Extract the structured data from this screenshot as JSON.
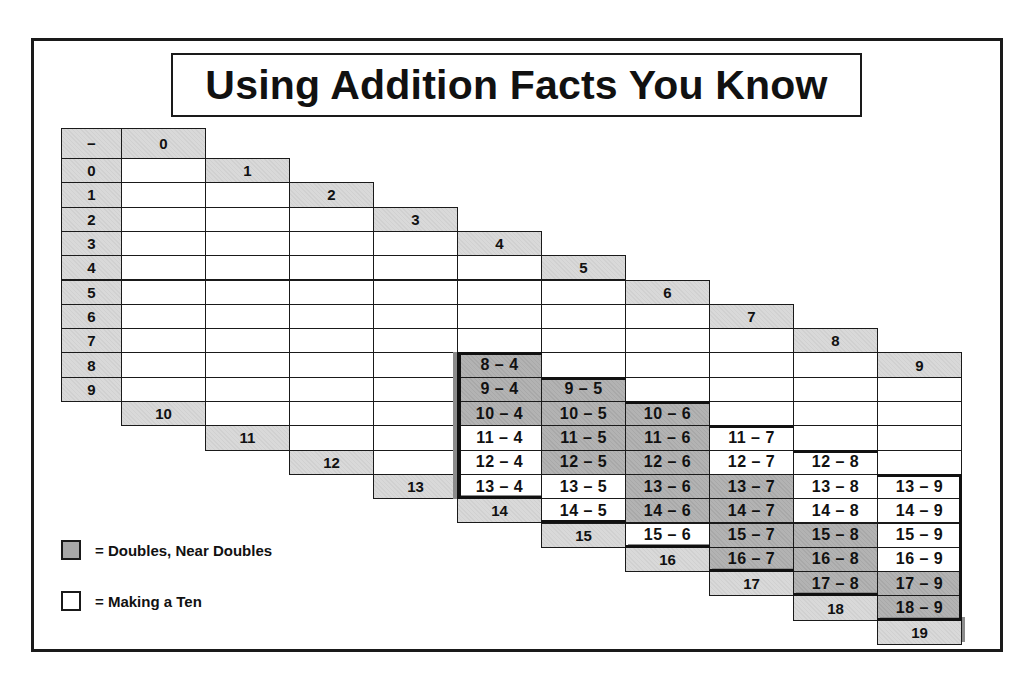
{
  "title": "Using Addition Facts You Know",
  "table": {
    "corner_symbol": "−",
    "column_headers": [
      "0",
      "1",
      "2",
      "3",
      "4",
      "5",
      "6",
      "7",
      "8",
      "9"
    ],
    "row_labels": [
      "0",
      "1",
      "2",
      "3",
      "4",
      "5",
      "6",
      "7",
      "8",
      "9"
    ],
    "bottom_labels": [
      "10",
      "11",
      "12",
      "13",
      "14",
      "15",
      "16",
      "17",
      "18",
      "19"
    ],
    "facts": [
      {
        "col": 4,
        "minuend": 8,
        "text": "8 – 4",
        "shade": "gray"
      },
      {
        "col": 4,
        "minuend": 9,
        "text": "9 – 4",
        "shade": "gray"
      },
      {
        "col": 4,
        "minuend": 10,
        "text": "10 – 4",
        "shade": "gray"
      },
      {
        "col": 4,
        "minuend": 11,
        "text": "11 – 4",
        "shade": "white"
      },
      {
        "col": 4,
        "minuend": 12,
        "text": "12 – 4",
        "shade": "white"
      },
      {
        "col": 4,
        "minuend": 13,
        "text": "13 – 4",
        "shade": "white"
      },
      {
        "col": 5,
        "minuend": 9,
        "text": "9 – 5",
        "shade": "gray"
      },
      {
        "col": 5,
        "minuend": 10,
        "text": "10 – 5",
        "shade": "gray"
      },
      {
        "col": 5,
        "minuend": 11,
        "text": "11 – 5",
        "shade": "gray"
      },
      {
        "col": 5,
        "minuend": 12,
        "text": "12 – 5",
        "shade": "gray"
      },
      {
        "col": 5,
        "minuend": 13,
        "text": "13 – 5",
        "shade": "white"
      },
      {
        "col": 5,
        "minuend": 14,
        "text": "14 – 5",
        "shade": "white"
      },
      {
        "col": 6,
        "minuend": 10,
        "text": "10 – 6",
        "shade": "gray"
      },
      {
        "col": 6,
        "minuend": 11,
        "text": "11 – 6",
        "shade": "gray"
      },
      {
        "col": 6,
        "minuend": 12,
        "text": "12 – 6",
        "shade": "gray"
      },
      {
        "col": 6,
        "minuend": 13,
        "text": "13 – 6",
        "shade": "gray"
      },
      {
        "col": 6,
        "minuend": 14,
        "text": "14 – 6",
        "shade": "gray"
      },
      {
        "col": 6,
        "minuend": 15,
        "text": "15 – 6",
        "shade": "white"
      },
      {
        "col": 7,
        "minuend": 11,
        "text": "11 – 7",
        "shade": "white"
      },
      {
        "col": 7,
        "minuend": 12,
        "text": "12 – 7",
        "shade": "white"
      },
      {
        "col": 7,
        "minuend": 13,
        "text": "13 – 7",
        "shade": "gray"
      },
      {
        "col": 7,
        "minuend": 14,
        "text": "14 – 7",
        "shade": "gray"
      },
      {
        "col": 7,
        "minuend": 15,
        "text": "15 – 7",
        "shade": "gray"
      },
      {
        "col": 7,
        "minuend": 16,
        "text": "16 – 7",
        "shade": "gray"
      },
      {
        "col": 8,
        "minuend": 12,
        "text": "12 – 8",
        "shade": "white"
      },
      {
        "col": 8,
        "minuend": 13,
        "text": "13 – 8",
        "shade": "white"
      },
      {
        "col": 8,
        "minuend": 14,
        "text": "14 – 8",
        "shade": "white"
      },
      {
        "col": 8,
        "minuend": 15,
        "text": "15 – 8",
        "shade": "gray"
      },
      {
        "col": 8,
        "minuend": 16,
        "text": "16 – 8",
        "shade": "gray"
      },
      {
        "col": 8,
        "minuend": 17,
        "text": "17 – 8",
        "shade": "gray"
      },
      {
        "col": 9,
        "minuend": 13,
        "text": "13 – 9",
        "shade": "white"
      },
      {
        "col": 9,
        "minuend": 14,
        "text": "14 – 9",
        "shade": "white"
      },
      {
        "col": 9,
        "minuend": 15,
        "text": "15 – 9",
        "shade": "white"
      },
      {
        "col": 9,
        "minuend": 16,
        "text": "16 – 9",
        "shade": "white"
      },
      {
        "col": 9,
        "minuend": 17,
        "text": "17 – 9",
        "shade": "gray"
      },
      {
        "col": 9,
        "minuend": 18,
        "text": "18 – 9",
        "shade": "gray"
      }
    ]
  },
  "legend": {
    "items": [
      {
        "swatch": "gray",
        "label": "= Doubles, Near Doubles"
      },
      {
        "swatch": "white",
        "label": "= Making a Ten"
      }
    ]
  },
  "colors": {
    "label_fill": "#d9d9d9",
    "doubles_fill": "#b3b3b3",
    "making_ten_fill": "#ffffff",
    "border": "#1a1a1a"
  }
}
